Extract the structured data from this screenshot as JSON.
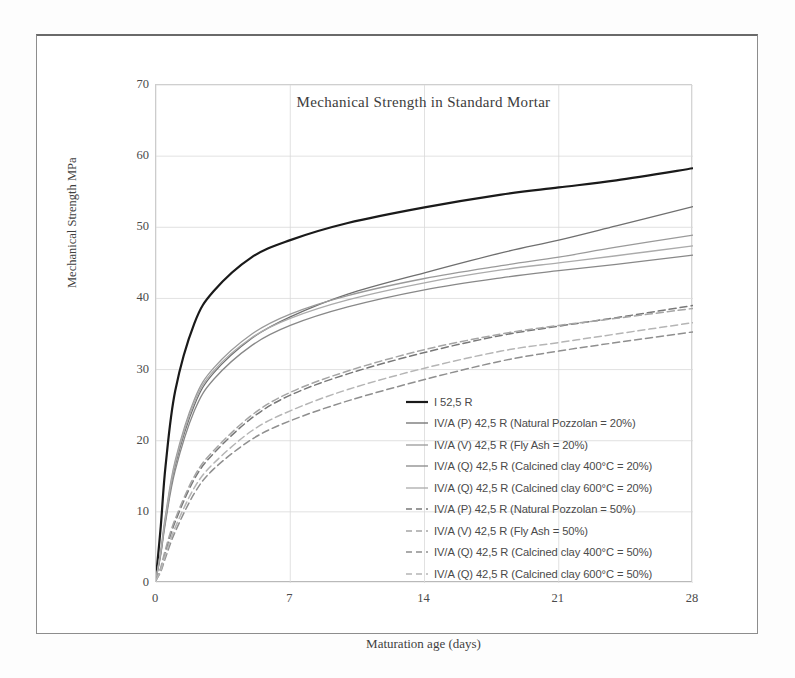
{
  "chart_data": {
    "type": "line",
    "title": "Mechanical  Strength in Standard Mortar",
    "xlabel": "Maturation age (days)",
    "ylabel": "Mechanical Strength MPa",
    "xlim": [
      0,
      28
    ],
    "ylim": [
      0,
      70
    ],
    "xticks": [
      "0",
      "7",
      "14",
      "21",
      "28"
    ],
    "yticks": [
      "70",
      "60",
      "50",
      "40",
      "30",
      "20",
      "10",
      "0"
    ],
    "grid": true,
    "legend_position": "inside-lower-right",
    "x": [
      0,
      0.25,
      0.5,
      1,
      2,
      3,
      5,
      7,
      10,
      14,
      18,
      21,
      24,
      28
    ],
    "series": [
      {
        "name": "I 52,5 R",
        "label": "I 52,5 R",
        "color": "#1a1a1a",
        "width": 2.2,
        "dash": "none",
        "values": [
          0.8,
          8.0,
          16.5,
          27.0,
          36.5,
          41.0,
          45.8,
          48.2,
          50.6,
          52.8,
          54.6,
          55.6,
          56.6,
          58.3
        ]
      },
      {
        "name": "IV/A (P) 42,5 R (Natural Pozzolan = 20%)",
        "label": "IV/A (P) 42,5 R  (Natural Pozzolan = 20%)",
        "color": "#6f6f6f",
        "width": 1.3,
        "dash": "none",
        "values": [
          0.6,
          4.2,
          9.0,
          16.5,
          25.0,
          29.5,
          34.4,
          37.4,
          40.6,
          43.6,
          46.4,
          48.2,
          50.2,
          52.9
        ]
      },
      {
        "name": "IV/A (V) 42,5 R (Fly Ash = 20%)",
        "label": "IV/A (V) 42,5 R  (Fly Ash = 20%)",
        "color": "#9a9a9a",
        "width": 1.3,
        "dash": "none",
        "values": [
          0.6,
          4.6,
          9.6,
          17.2,
          25.8,
          30.2,
          35.0,
          37.8,
          40.4,
          42.8,
          44.6,
          45.8,
          47.2,
          48.9
        ]
      },
      {
        "name": "IV/A (Q) 42,5 R (Calcined clay 400°C = 20%)",
        "label": "IV/A (Q) 42,5 R  (Calcined clay 400°C = 20%)",
        "color": "#888888",
        "width": 1.3,
        "dash": "none",
        "values": [
          0.6,
          4.0,
          8.6,
          15.8,
          24.2,
          28.6,
          33.4,
          36.2,
          38.8,
          41.2,
          42.9,
          43.9,
          44.8,
          46.1
        ]
      },
      {
        "name": "IV/A (Q) 42,5 R (Calcined clay 600°C = 20%)",
        "label": "IV/A (Q) 42,5 R  (Calcined clay 600°C = 20%)",
        "color": "#ababab",
        "width": 1.3,
        "dash": "none",
        "values": [
          0.6,
          4.4,
          9.2,
          16.8,
          25.4,
          29.8,
          34.5,
          37.2,
          39.8,
          42.2,
          44.0,
          45.0,
          46.0,
          47.4
        ]
      },
      {
        "name": "IV/A (P) 42,5 R (Natural Pozzolan = 50%)",
        "label": "IV/A (P) 42,5 R  (Natural Pozzolan = 50%)",
        "color": "#787878",
        "width": 1.5,
        "dash": "7,4",
        "values": [
          0.4,
          2.0,
          4.4,
          8.6,
          14.6,
          18.2,
          23.2,
          26.4,
          29.4,
          32.4,
          34.8,
          36.1,
          37.3,
          39.0
        ]
      },
      {
        "name": "IV/A (V) 42,5 R (Fly Ash = 50%)",
        "label": "IV/A (V) 42,5 R  (Fly Ash = 50%)",
        "color": "#a5a5a5",
        "width": 1.5,
        "dash": "7,4",
        "values": [
          0.4,
          2.2,
          4.8,
          9.0,
          15.0,
          18.6,
          23.6,
          26.8,
          29.8,
          32.8,
          35.0,
          36.2,
          37.2,
          38.6
        ]
      },
      {
        "name": "IV/A (Q) 42,5 R (Calcined clay 400°C = 50%)",
        "label": "IV/A (Q) 42,5 R  (Calcined clay 400°C = 50%)",
        "color": "#8f8f8f",
        "width": 1.5,
        "dash": "7,4",
        "values": [
          0.4,
          1.6,
          3.6,
          7.2,
          12.6,
          16.0,
          20.2,
          22.8,
          25.6,
          28.6,
          31.2,
          32.6,
          33.8,
          35.3
        ]
      },
      {
        "name": "IV/A (Q) 42,5 R (Calcined clay 600°C = 50%)",
        "label": "IV/A (Q) 42,5 R  (Calcined clay 600°C = 50%)",
        "color": "#b5b5b5",
        "width": 1.5,
        "dash": "7,4",
        "values": [
          0.4,
          1.8,
          4.0,
          7.8,
          13.4,
          16.8,
          21.4,
          24.2,
          27.2,
          30.2,
          32.6,
          33.8,
          35.0,
          36.6
        ]
      }
    ]
  },
  "colors": {
    "background": "#ffffff",
    "frame": "#8d8d8d",
    "grid": "#d9d9d9",
    "text": "#3f3f3f"
  }
}
